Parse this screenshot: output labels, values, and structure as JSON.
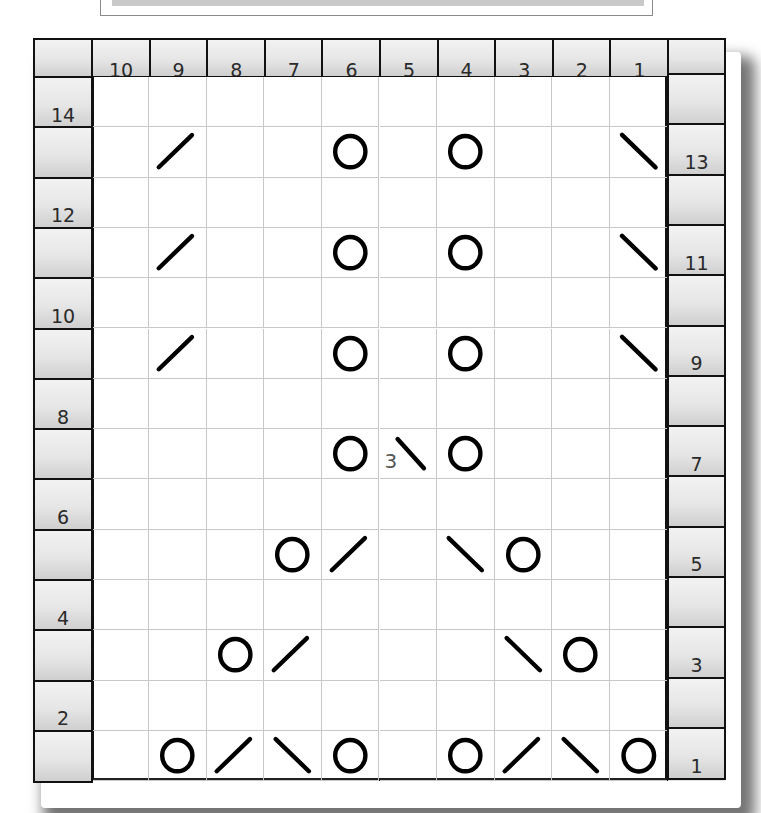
{
  "chart_data": {
    "type": "table",
    "title": "",
    "columns": [
      10,
      9,
      8,
      7,
      6,
      5,
      4,
      3,
      2,
      1
    ],
    "rows_top_to_bottom": [
      14,
      13,
      12,
      11,
      10,
      9,
      8,
      7,
      6,
      5,
      4,
      3,
      2,
      1
    ],
    "left_row_labels": [
      "14",
      "12",
      "10",
      "8",
      "6",
      "4",
      "2"
    ],
    "right_row_labels": [
      "13",
      "11",
      "9",
      "7",
      "5",
      "3",
      "1"
    ],
    "symbol_legend": {
      "O": "yarn over",
      "/": "right-leaning decrease",
      "\\": "left-leaning decrease",
      "3\\": "3-stitch decrease"
    },
    "grid": {
      "14": [
        "",
        "",
        "",
        "",
        "",
        "",
        "",
        "",
        "",
        ""
      ],
      "13": [
        "",
        "/",
        "",
        "",
        "O",
        "",
        "O",
        "",
        "",
        "\\"
      ],
      "12": [
        "",
        "",
        "",
        "",
        "",
        "",
        "",
        "",
        "",
        ""
      ],
      "11": [
        "",
        "/",
        "",
        "",
        "O",
        "",
        "O",
        "",
        "",
        "\\"
      ],
      "10": [
        "",
        "",
        "",
        "",
        "",
        "",
        "",
        "",
        "",
        ""
      ],
      "9": [
        "",
        "/",
        "",
        "",
        "O",
        "",
        "O",
        "",
        "",
        "\\"
      ],
      "8": [
        "",
        "",
        "",
        "",
        "",
        "",
        "",
        "",
        "",
        ""
      ],
      "7": [
        "",
        "",
        "",
        "",
        "O",
        "3\\",
        "O",
        "",
        "",
        ""
      ],
      "6": [
        "",
        "",
        "",
        "",
        "",
        "",
        "",
        "",
        "",
        ""
      ],
      "5": [
        "",
        "",
        "",
        "O",
        "/",
        "",
        "\\",
        "O",
        "",
        ""
      ],
      "4": [
        "",
        "",
        "",
        "",
        "",
        "",
        "",
        "",
        "",
        ""
      ],
      "3": [
        "",
        "",
        "O",
        "/",
        "",
        "",
        "",
        "\\",
        "O",
        ""
      ],
      "2": [
        "",
        "",
        "",
        "",
        "",
        "",
        "",
        "",
        "",
        ""
      ],
      "1": [
        "",
        "O",
        "/",
        "\\",
        "O",
        "",
        "O",
        "/",
        "\\",
        "O"
      ]
    },
    "annotations": [
      "3"
    ]
  },
  "header": {
    "column_labels": [
      "10",
      "9",
      "8",
      "7",
      "6",
      "5",
      "4",
      "3",
      "2",
      "1"
    ]
  },
  "left_labels": {
    "r14": "14",
    "r12": "12",
    "r10": "10",
    "r8": "8",
    "r6": "6",
    "r4": "4",
    "r2": "2"
  },
  "right_labels": {
    "r13": "13",
    "r11": "11",
    "r9": "9",
    "r7": "7",
    "r5": "5",
    "r3": "3",
    "r1": "1"
  },
  "annotation_3": "3"
}
